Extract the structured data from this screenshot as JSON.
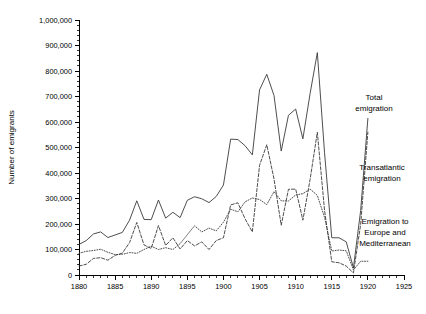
{
  "chart_data": {
    "type": "line",
    "title": "",
    "xlabel": "",
    "ylabel": "Number of emigrants",
    "xlim": [
      1880,
      1925
    ],
    "ylim": [
      0,
      1000000
    ],
    "grid": false,
    "legend_position": "inline-right-annotations",
    "xticks": [
      1880,
      1885,
      1890,
      1895,
      1900,
      1905,
      1910,
      1915,
      1920,
      1925
    ],
    "xticklabels": [
      "1880",
      "1885",
      "1890",
      "1895",
      "1900",
      "1905",
      "1910",
      "1915",
      "1920",
      "1925"
    ],
    "xtick_minor_step": 1,
    "yticks": [
      0,
      100000,
      200000,
      300000,
      400000,
      500000,
      600000,
      700000,
      800000,
      900000,
      1000000
    ],
    "yticklabels": [
      "0",
      "100,000",
      "200,000",
      "300,000",
      "400,000",
      "500,000",
      "600,000",
      "700,000",
      "800,000",
      "900,000",
      "1,000,000"
    ],
    "ytick_minor_step": 20000,
    "x": [
      1880,
      1881,
      1882,
      1883,
      1884,
      1885,
      1886,
      1887,
      1888,
      1889,
      1890,
      1891,
      1892,
      1893,
      1894,
      1895,
      1896,
      1897,
      1898,
      1899,
      1900,
      1901,
      1902,
      1903,
      1904,
      1905,
      1906,
      1907,
      1908,
      1909,
      1910,
      1911,
      1912,
      1913,
      1914,
      1915,
      1916,
      1917,
      1918,
      1919,
      1920
    ],
    "series": [
      {
        "name": "Total emigration",
        "style": "solid",
        "color": "#3a3a3a",
        "values": [
          120000,
          135000,
          161000,
          169000,
          147000,
          157000,
          167000,
          215000,
          291000,
          218000,
          217000,
          294000,
          223000,
          246000,
          225000,
          293000,
          307000,
          299000,
          284000,
          308000,
          353000,
          533000,
          531000,
          507000,
          471000,
          726000,
          787000,
          704000,
          486000,
          626000,
          651000,
          534000,
          712000,
          872000,
          479000,
          146000,
          146000,
          130000,
          28000,
          253000,
          614000
        ]
      },
      {
        "name": "Transatlantic emigration",
        "style": "dashed",
        "color": "#3a3a3a",
        "values": [
          35000,
          42000,
          65000,
          68000,
          58000,
          77000,
          86000,
          127000,
          206000,
          118000,
          104000,
          194000,
          116000,
          146000,
          102000,
          135000,
          114000,
          130000,
          100000,
          135000,
          146000,
          275000,
          283000,
          220000,
          169000,
          430000,
          511000,
          377000,
          195000,
          336000,
          337000,
          215000,
          375000,
          560000,
          253000,
          52000,
          48000,
          35000,
          8000,
          199000,
          560000
        ]
      },
      {
        "name": "Emigration to Europe and Mediterranean",
        "style": "dotted",
        "color": "#3a3a3a",
        "values": [
          85000,
          93000,
          96000,
          101000,
          89000,
          80000,
          81000,
          88000,
          85000,
          100000,
          113000,
          100000,
          107000,
          100000,
          123000,
          158000,
          193000,
          169000,
          184000,
          173000,
          207000,
          258000,
          248000,
          287000,
          302000,
          296000,
          276000,
          327000,
          291000,
          290000,
          314000,
          319000,
          337000,
          312000,
          226000,
          94000,
          98000,
          95000,
          20000,
          54000,
          54000
        ]
      }
    ],
    "annotations": [
      {
        "name": "total-emigration-label",
        "lines": [
          "Total",
          "emigration"
        ],
        "x_px": 374,
        "y_px": 100
      },
      {
        "name": "transatlantic-emigration-label",
        "lines": [
          "Transatlantic",
          "emigration"
        ],
        "x_px": 382,
        "y_px": 170
      },
      {
        "name": "europe-mediterranean-label",
        "lines": [
          "Emigration to",
          "Europe and",
          "Mediterranean"
        ],
        "x_px": 385,
        "y_px": 224
      }
    ]
  }
}
